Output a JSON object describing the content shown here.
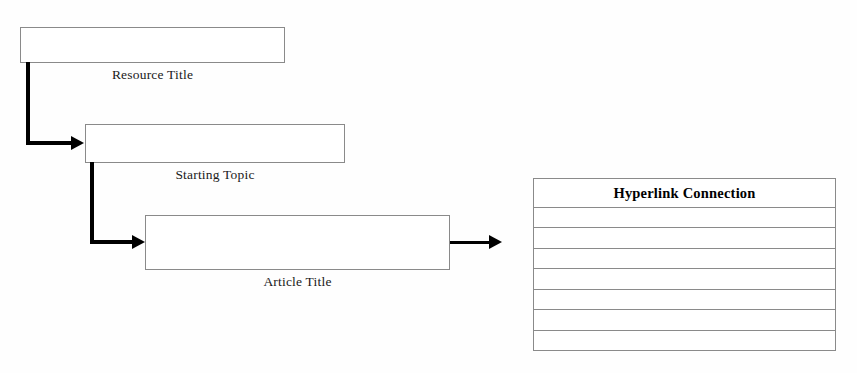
{
  "diagram": {
    "background_color": "#fefefe",
    "box_border_color": "#8a8a8a",
    "connector_color": "#000000",
    "nodes": [
      {
        "id": "resource-title",
        "label": "Resource Title",
        "x": 20,
        "y": 27,
        "width": 265,
        "height": 36
      },
      {
        "id": "starting-topic",
        "label": "Starting Topic",
        "x": 85,
        "y": 124,
        "width": 260,
        "height": 39
      },
      {
        "id": "article-title",
        "label": "Article Title",
        "x": 145,
        "y": 215,
        "width": 305,
        "height": 55
      }
    ],
    "connectors": [
      {
        "id": "resource-to-topic",
        "from": "resource-title",
        "to": "starting-topic",
        "style": "elbow",
        "arrowhead": "filled-triangle"
      },
      {
        "id": "topic-to-article",
        "from": "starting-topic",
        "to": "article-title",
        "style": "elbow",
        "arrowhead": "filled-triangle"
      },
      {
        "id": "article-to-table",
        "from": "article-title",
        "to": "hyperlink-connection-table",
        "style": "straight",
        "arrowhead": "filled-triangle"
      }
    ],
    "table": {
      "id": "hyperlink-connection-table",
      "header": "Hyperlink Connection",
      "x": 533,
      "y": 178,
      "width": 303,
      "height": 173,
      "rows": [
        "",
        "",
        "",
        "",
        "",
        "",
        ""
      ]
    }
  }
}
